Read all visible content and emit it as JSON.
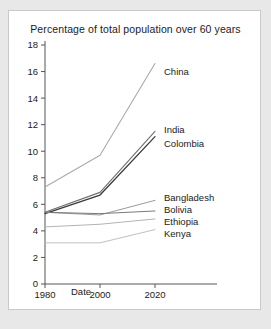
{
  "card": {
    "background": "#ffffff",
    "border_color": "#c9c9c9"
  },
  "page": {
    "background": "#e8e8e8"
  },
  "chart_data": {
    "type": "line",
    "title": "Percentage of total population over 60 years",
    "xlabel": "Date",
    "ylabel": "",
    "x": [
      1980,
      2000,
      2020
    ],
    "xtick_labels": [
      "1980",
      "2000",
      "2020"
    ],
    "ytick_labels": [
      "0",
      "2",
      "4",
      "6",
      "8",
      "10",
      "12",
      "14",
      "16",
      "18"
    ],
    "yticks": [
      0,
      2,
      4,
      6,
      8,
      10,
      12,
      14,
      16,
      18
    ],
    "xlim": [
      1980,
      2020
    ],
    "ylim": [
      0,
      18
    ],
    "grid": false,
    "legend_position": "right-inline-labels",
    "series": [
      {
        "name": "China",
        "values": [
          7.3,
          9.7,
          16.6
        ],
        "color": "#aaaaaa",
        "width": 1.1,
        "label_y": 16.0
      },
      {
        "name": "India",
        "values": [
          5.4,
          6.9,
          11.5
        ],
        "color": "#6f6f6f",
        "width": 1.1,
        "label_y": 11.6
      },
      {
        "name": "Colombia",
        "values": [
          5.3,
          6.7,
          11.1
        ],
        "color": "#3a3a3a",
        "width": 1.3,
        "label_y": 10.6
      },
      {
        "name": "Bangladesh",
        "values": [
          5.4,
          5.2,
          6.3
        ],
        "color": "#9a9a9a",
        "width": 1.0,
        "label_y": 6.5
      },
      {
        "name": "Bolivia",
        "values": [
          5.4,
          5.3,
          5.5
        ],
        "color": "#7a7a7a",
        "width": 1.0,
        "label_y": 5.6
      },
      {
        "name": "Ethiopia",
        "values": [
          4.3,
          4.5,
          4.9
        ],
        "color": "#b4b4b4",
        "width": 1.0,
        "label_y": 4.7
      },
      {
        "name": "Kenya",
        "values": [
          3.1,
          3.1,
          4.1
        ],
        "color": "#c0c0c0",
        "width": 1.0,
        "label_y": 3.8
      }
    ]
  }
}
